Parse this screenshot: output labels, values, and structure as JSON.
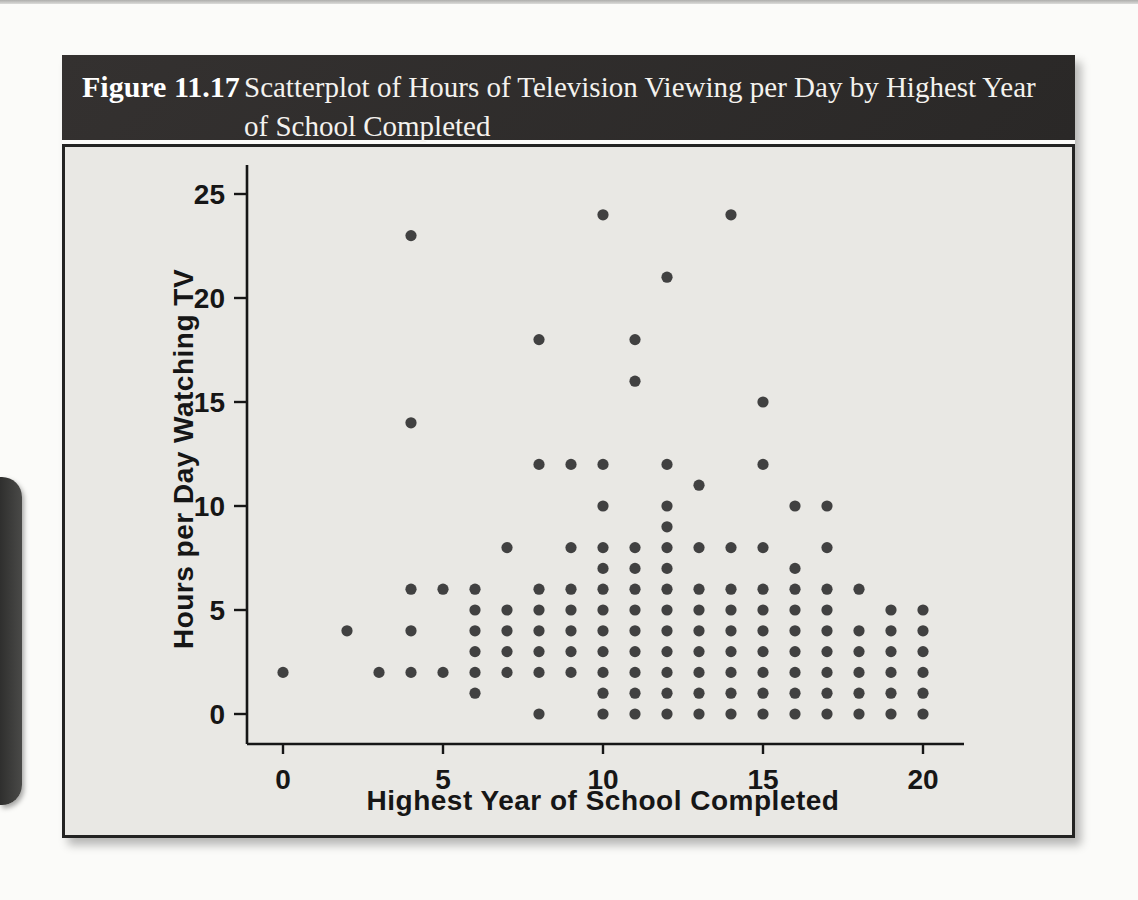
{
  "figure": {
    "label": "Figure 11.17",
    "title": "Scatterplot of Hours of Television Viewing per Day by Highest Year of School Completed"
  },
  "colors": {
    "header_bg": "#2e2b29",
    "content_bg": "#e9e8e4",
    "dot": "#414141",
    "axis": "#161616",
    "page_tab": "#3d3d3c"
  },
  "chart_data": {
    "type": "scatter",
    "title": "Scatterplot of Hours of Television Viewing per Day by Highest Year of School Completed",
    "xlabel": "Highest Year of School Completed",
    "ylabel": "Hours per Day Watching TV",
    "xlim": [
      -1.2,
      21.5
    ],
    "ylim": [
      -1.5,
      26.5
    ],
    "x_ticks": [
      0,
      5,
      10,
      15,
      20
    ],
    "y_ticks": [
      0,
      5,
      10,
      15,
      20,
      25
    ],
    "grid": false,
    "legend": false,
    "points": [
      [
        0,
        2
      ],
      [
        2,
        4
      ],
      [
        3,
        2
      ],
      [
        4,
        2
      ],
      [
        4,
        4
      ],
      [
        4,
        6
      ],
      [
        4,
        14
      ],
      [
        4,
        23
      ],
      [
        5,
        2
      ],
      [
        5,
        6
      ],
      [
        6,
        1
      ],
      [
        6,
        2
      ],
      [
        6,
        3
      ],
      [
        6,
        4
      ],
      [
        6,
        5
      ],
      [
        6,
        6
      ],
      [
        7,
        2
      ],
      [
        7,
        3
      ],
      [
        7,
        4
      ],
      [
        7,
        5
      ],
      [
        7,
        8
      ],
      [
        8,
        0
      ],
      [
        8,
        2
      ],
      [
        8,
        3
      ],
      [
        8,
        4
      ],
      [
        8,
        5
      ],
      [
        8,
        6
      ],
      [
        8,
        12
      ],
      [
        8,
        18
      ],
      [
        9,
        2
      ],
      [
        9,
        3
      ],
      [
        9,
        4
      ],
      [
        9,
        5
      ],
      [
        9,
        6
      ],
      [
        9,
        8
      ],
      [
        9,
        12
      ],
      [
        10,
        0
      ],
      [
        10,
        1
      ],
      [
        10,
        2
      ],
      [
        10,
        3
      ],
      [
        10,
        4
      ],
      [
        10,
        5
      ],
      [
        10,
        6
      ],
      [
        10,
        7
      ],
      [
        10,
        8
      ],
      [
        10,
        10
      ],
      [
        10,
        12
      ],
      [
        10,
        24
      ],
      [
        11,
        0
      ],
      [
        11,
        1
      ],
      [
        11,
        2
      ],
      [
        11,
        3
      ],
      [
        11,
        4
      ],
      [
        11,
        5
      ],
      [
        11,
        6
      ],
      [
        11,
        7
      ],
      [
        11,
        8
      ],
      [
        11,
        16
      ],
      [
        11,
        18
      ],
      [
        12,
        0
      ],
      [
        12,
        1
      ],
      [
        12,
        2
      ],
      [
        12,
        3
      ],
      [
        12,
        4
      ],
      [
        12,
        5
      ],
      [
        12,
        6
      ],
      [
        12,
        7
      ],
      [
        12,
        8
      ],
      [
        12,
        9
      ],
      [
        12,
        10
      ],
      [
        12,
        12
      ],
      [
        12,
        21
      ],
      [
        13,
        0
      ],
      [
        13,
        1
      ],
      [
        13,
        2
      ],
      [
        13,
        3
      ],
      [
        13,
        4
      ],
      [
        13,
        5
      ],
      [
        13,
        6
      ],
      [
        13,
        8
      ],
      [
        13,
        11
      ],
      [
        14,
        0
      ],
      [
        14,
        1
      ],
      [
        14,
        2
      ],
      [
        14,
        3
      ],
      [
        14,
        4
      ],
      [
        14,
        5
      ],
      [
        14,
        6
      ],
      [
        14,
        8
      ],
      [
        14,
        24
      ],
      [
        15,
        0
      ],
      [
        15,
        1
      ],
      [
        15,
        2
      ],
      [
        15,
        3
      ],
      [
        15,
        4
      ],
      [
        15,
        5
      ],
      [
        15,
        6
      ],
      [
        15,
        8
      ],
      [
        15,
        12
      ],
      [
        15,
        15
      ],
      [
        16,
        0
      ],
      [
        16,
        1
      ],
      [
        16,
        2
      ],
      [
        16,
        3
      ],
      [
        16,
        4
      ],
      [
        16,
        5
      ],
      [
        16,
        6
      ],
      [
        16,
        7
      ],
      [
        16,
        10
      ],
      [
        17,
        0
      ],
      [
        17,
        1
      ],
      [
        17,
        2
      ],
      [
        17,
        3
      ],
      [
        17,
        4
      ],
      [
        17,
        5
      ],
      [
        17,
        6
      ],
      [
        17,
        8
      ],
      [
        17,
        10
      ],
      [
        18,
        0
      ],
      [
        18,
        1
      ],
      [
        18,
        2
      ],
      [
        18,
        3
      ],
      [
        18,
        4
      ],
      [
        18,
        6
      ],
      [
        19,
        0
      ],
      [
        19,
        1
      ],
      [
        19,
        2
      ],
      [
        19,
        3
      ],
      [
        19,
        4
      ],
      [
        19,
        5
      ],
      [
        20,
        0
      ],
      [
        20,
        1
      ],
      [
        20,
        2
      ],
      [
        20,
        3
      ],
      [
        20,
        4
      ],
      [
        20,
        5
      ]
    ]
  }
}
